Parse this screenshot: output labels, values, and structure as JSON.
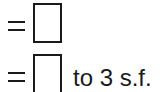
{
  "rows": [
    {
      "operator": "=",
      "answer_value": "",
      "suffix": ""
    },
    {
      "operator": "=",
      "answer_value": "",
      "suffix": "to 3 s.f."
    }
  ]
}
